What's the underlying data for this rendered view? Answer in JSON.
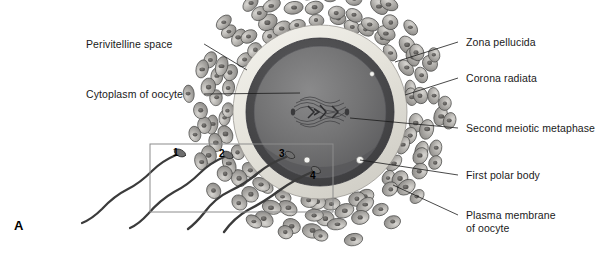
{
  "figure": {
    "panel_letter": "A",
    "background_color": "#ffffff",
    "width": 610,
    "height": 254
  },
  "labels_left": [
    {
      "text": "Perivitelline space",
      "x": 86,
      "y": 38,
      "leader_to_x": 247,
      "leader_to_y": 70
    },
    {
      "text": "Cytoplasm of oocyte",
      "x": 86,
      "y": 88,
      "leader_to_x": 300,
      "leader_to_y": 93
    }
  ],
  "labels_right": [
    {
      "text": "Zona pellucida",
      "x": 466,
      "y": 36,
      "leader_to_x": 395,
      "leader_to_y": 62
    },
    {
      "text": "Corona radiata",
      "x": 466,
      "y": 72,
      "leader_to_x": 405,
      "leader_to_y": 95
    },
    {
      "text": "Second meiotic metaphase",
      "x": 466,
      "y": 122,
      "leader_to_x": 350,
      "leader_to_y": 118
    },
    {
      "text": "First polar body",
      "x": 466,
      "y": 169,
      "leader_to_x": 360,
      "leader_to_y": 160
    },
    {
      "text": "Plasma membrane",
      "x": 466,
      "y": 209,
      "leader_to_x": 393,
      "leader_to_y": 185
    },
    {
      "text": "of oocyte",
      "x": 466,
      "y": 222,
      "leader_to_x": null,
      "leader_to_y": null
    }
  ],
  "sperm_numbers": [
    {
      "label": "1",
      "x": 173,
      "y": 147
    },
    {
      "label": "2",
      "x": 219,
      "y": 148
    },
    {
      "label": "3",
      "x": 279,
      "y": 148
    },
    {
      "label": "4",
      "x": 310,
      "y": 170
    }
  ],
  "structures": {
    "oocyte_center_x": 320,
    "oocyte_center_y": 112,
    "zona_pellucida_color": "#e8e6df",
    "cytoplasm_color": "#6f6f70",
    "cytoplasm_dark_rim_color": "#4a4a4c",
    "corona_cell_color": "#b4b2ae",
    "corona_cell_outline": "#4a4a48",
    "sperm_color": "#3b3b3b",
    "inset_box_color": "#8c8c8c",
    "leader_line_color": "#1a1a1a",
    "spindle_color": "#3a3a3c",
    "polar_body_color": "#f2f2f0"
  },
  "inset_box": {
    "x": 150,
    "y": 144,
    "width": 183,
    "height": 68
  }
}
